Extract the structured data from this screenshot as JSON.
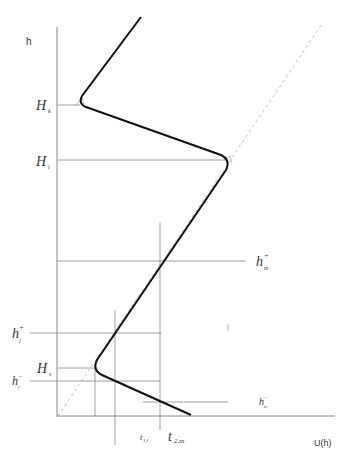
{
  "diagram": {
    "axes": {
      "y_label": "h",
      "x_label": "U(h)"
    },
    "levels": {
      "H_k": {
        "main": "H",
        "sub": "k"
      },
      "H_i": {
        "main": "H",
        "sub": "i"
      },
      "H_s": {
        "main": "H",
        "sub": "s"
      },
      "h_m_plus": {
        "main": "h",
        "sub": "m",
        "sup": "+"
      },
      "h_l_plus": {
        "main": "h",
        "sub": "l",
        "sup": "+"
      },
      "h_l_minus": {
        "main": "h",
        "sub": "l",
        "sup": "−"
      },
      "h_m_minus": {
        "main": "h",
        "sub": "m",
        "sup": "−"
      }
    },
    "times": {
      "t_1l": {
        "main": "t",
        "sub": "1,l"
      },
      "t_2m": {
        "main": "t",
        "sub": "2,m"
      }
    },
    "colors": {
      "curve": "#111111",
      "guide": "#888888",
      "dashed": "#bbbbbb"
    }
  }
}
